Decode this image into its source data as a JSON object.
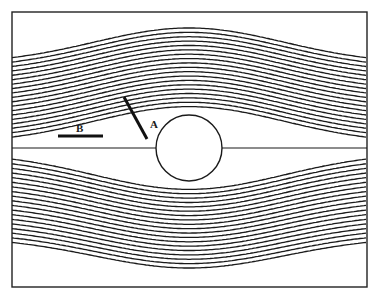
{
  "figure": {
    "frame": {
      "x": 12,
      "y": 12,
      "width": 355,
      "height": 275,
      "stroke": "#222222"
    },
    "cylinder": {
      "cx": 189,
      "cy": 148,
      "r": 33,
      "stroke": "#1a1a1a"
    },
    "centerline": {
      "y": 148
    },
    "streamlines": {
      "count_per_side": 19,
      "left_edge_top_y": 64,
      "left_edge_bottom_y": 237,
      "peak_top_y": 28,
      "trough_bottom_y": 268,
      "stroke": "#1a1a1a",
      "stroke_width": 1.3
    },
    "marker_A": {
      "label": "A",
      "line": {
        "x1": 124,
        "y1": 97,
        "x2": 147,
        "y2": 139
      },
      "label_pos": {
        "x": 150,
        "y": 128
      }
    },
    "marker_B": {
      "label": "B",
      "line": {
        "x1": 58,
        "y1": 136,
        "x2": 103,
        "y2": 136
      },
      "label_pos": {
        "x": 76,
        "y": 132
      }
    }
  }
}
